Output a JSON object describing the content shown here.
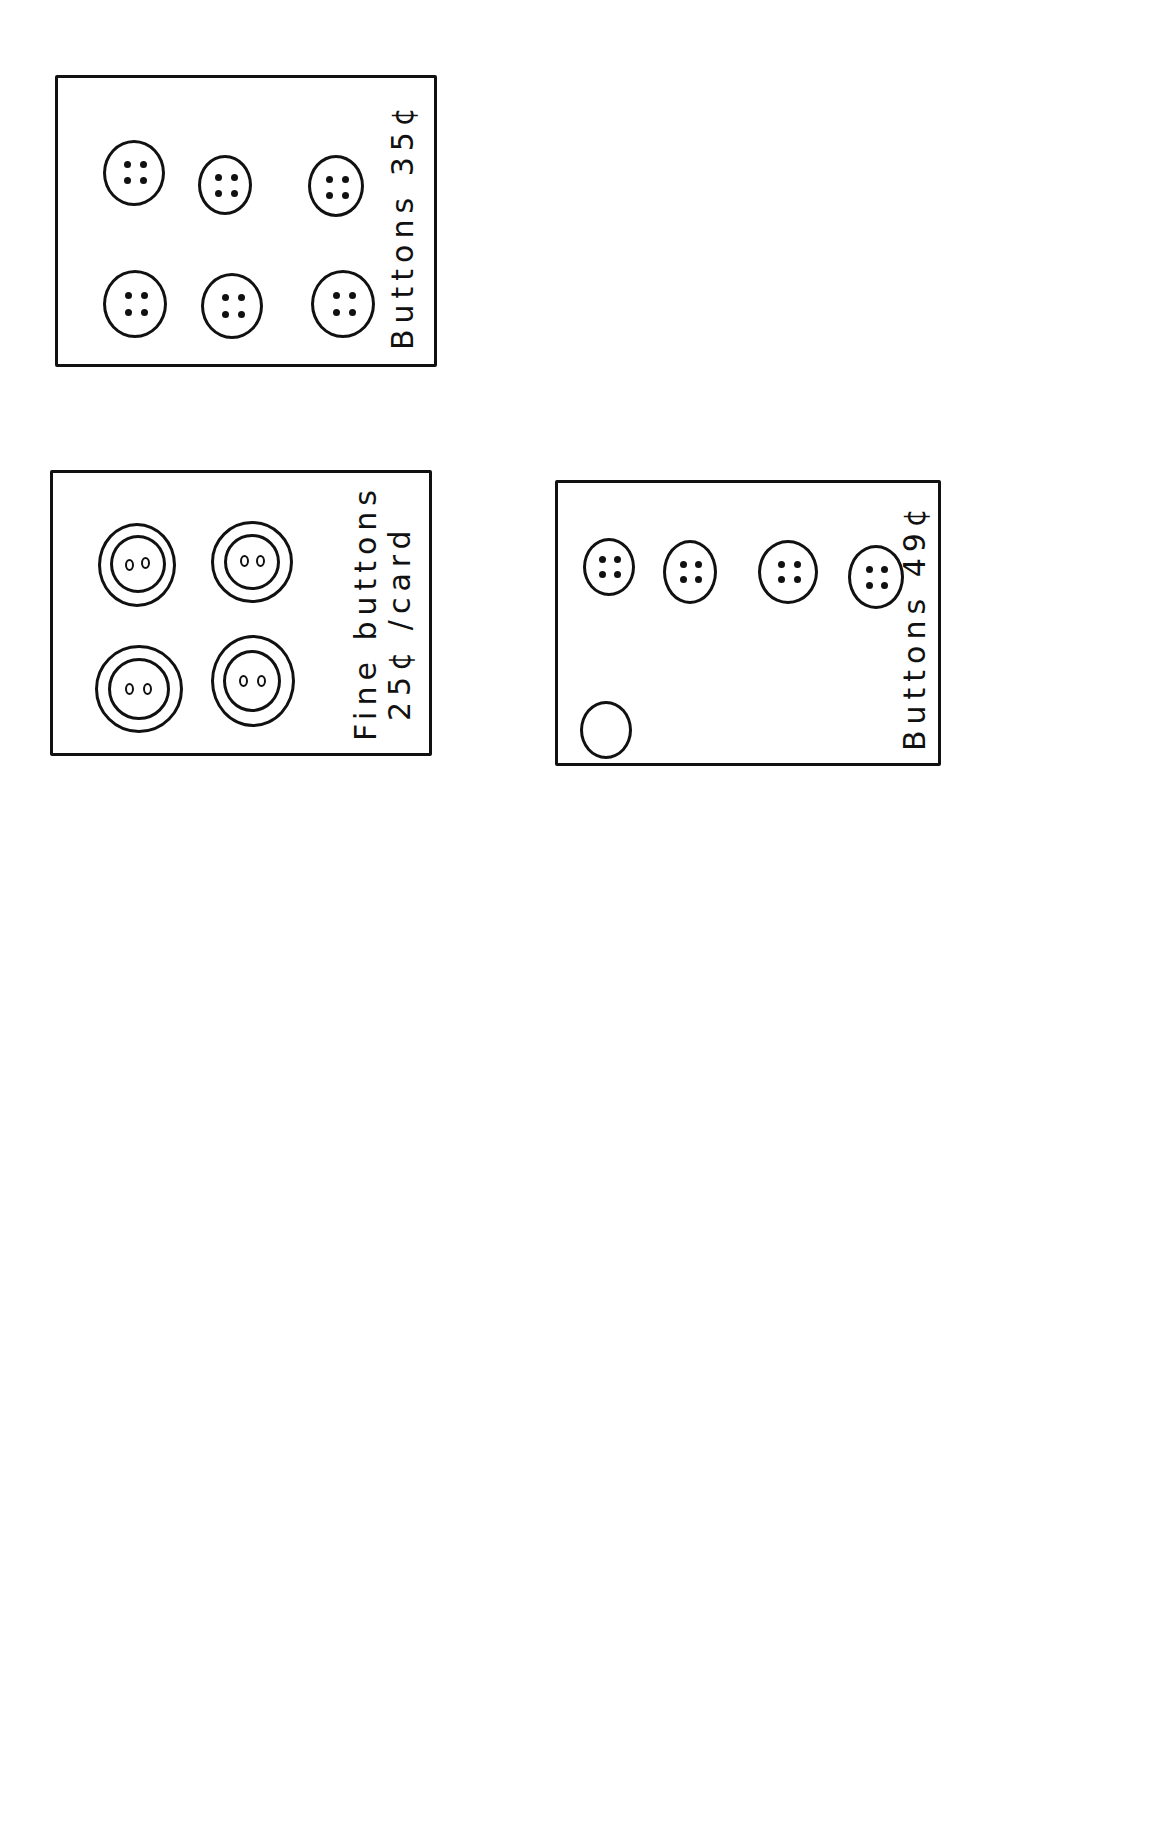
{
  "cards": [
    {
      "id": "card-1",
      "label_line1": "Buttons   35¢",
      "label_line2": "",
      "button_count": 6,
      "button_type": "four-hole",
      "price_cents": 35
    },
    {
      "id": "card-2",
      "label_line1": "Fine  buttons",
      "label_line2": "25¢ /card",
      "button_count": 4,
      "button_type": "fine two-hole (double ring)",
      "price_cents": 25
    },
    {
      "id": "card-3",
      "label_line1": "Buttons   49¢",
      "label_line2": "",
      "button_count": 8,
      "button_type": "four-hole",
      "price_cents": 49
    },
    {
      "id": "card-4",
      "label_line1": "Fine  buttons",
      "label_line2": "25¢ /card",
      "button_count": 4,
      "button_type": "fine two-hole (double ring)",
      "price_cents": 25
    },
    {
      "id": "card-5",
      "label_line1": "Buttons   19¢",
      "label_line2": "",
      "button_count": 3,
      "button_type": "oval two-hole (double ring)",
      "price_cents": 19
    },
    {
      "id": "card-6",
      "label_line1": "Fine buttons",
      "label_line2": "25¢/Card",
      "button_count": 4,
      "button_type": "fine two-hole (double ring)",
      "price_cents": 25
    },
    {
      "id": "card-7",
      "label_line1": "Buttons   19¢",
      "label_line2": "",
      "button_count": 3,
      "button_type": "oval two-hole (double ring)",
      "price_cents": 19
    }
  ],
  "colors": {
    "ink": "#111111",
    "paper": "#ffffff"
  }
}
